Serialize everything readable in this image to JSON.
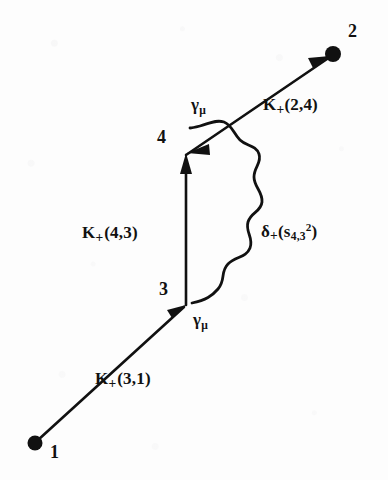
{
  "diagram": {
    "type": "feynman-diagram",
    "background_color": "#fdfdfd",
    "ink_color": "#111111",
    "endpoints": [
      {
        "id": "1",
        "label": "1",
        "x": 35,
        "y": 443,
        "kind": "filled-dot"
      },
      {
        "id": "2",
        "label": "2",
        "x": 333,
        "y": 54,
        "kind": "filled-dot"
      }
    ],
    "vertices": [
      {
        "id": "3",
        "label": "3",
        "x": 186,
        "y": 305
      },
      {
        "id": "4",
        "label": "4",
        "x": 186,
        "y": 155
      }
    ],
    "propagators": [
      {
        "id": "k31",
        "from": "1",
        "to": "3",
        "style": "straight-arrow",
        "label": "K+(3,1)"
      },
      {
        "id": "k43",
        "from": "3",
        "to": "4",
        "style": "straight-arrow",
        "label": "K+(4,3)"
      },
      {
        "id": "k24",
        "from": "4",
        "to": "2",
        "style": "straight-arrow",
        "label": "K+(2,4)"
      },
      {
        "id": "photon",
        "from": "3",
        "to": "4",
        "style": "wavy",
        "label": "delta+(s_4,3^2)"
      }
    ],
    "labels": {
      "k_2_4": {
        "base": "K",
        "plus": "+",
        "args": "(2,4)"
      },
      "k_4_3": {
        "base": "K",
        "plus": "+",
        "args": "(4,3)"
      },
      "k_3_1": {
        "base": "K",
        "plus": "+",
        "args": "(3,1)"
      },
      "delta": {
        "base": "δ",
        "plus": "+",
        "open": "(s",
        "sub": "4,3",
        "sup": "2",
        "close": ")"
      },
      "gamma_upper": {
        "base": "γ",
        "sub": "μ"
      },
      "gamma_lower": {
        "base": "γ",
        "sub": "μ"
      },
      "node_1": "1",
      "node_2": "2",
      "node_3": "3",
      "node_4": "4"
    }
  }
}
